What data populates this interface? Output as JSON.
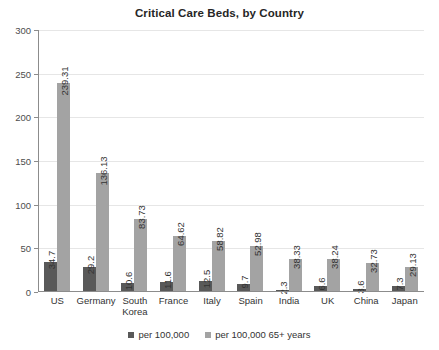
{
  "chart_data": {
    "type": "bar",
    "title": "Critical Care Beds, by Country",
    "xlabel": "",
    "ylabel": "",
    "ylim": [
      0,
      300
    ],
    "yticks": [
      0,
      50,
      100,
      150,
      200,
      250,
      300
    ],
    "grid": true,
    "legend_position": "bottom",
    "categories": [
      "US",
      "Germany",
      "South Korea",
      "France",
      "Italy",
      "Spain",
      "India",
      "UK",
      "China",
      "Japan"
    ],
    "series": [
      {
        "name": "per 100,000",
        "color": "#595959",
        "values": [
          34.7,
          29.2,
          10.6,
          11.6,
          12.5,
          9.7,
          2.3,
          6.6,
          3.6,
          7.3
        ],
        "labels": [
          "34.7",
          "29.2",
          "10.6",
          "11.6",
          "12.5",
          "9.7",
          "2.3",
          "6.6",
          "3.6",
          "7.3"
        ]
      },
      {
        "name": "per 100,000 65+ years",
        "color": "#a3a3a3",
        "values": [
          239.31,
          136.13,
          83.73,
          64.62,
          58.82,
          52.98,
          38.33,
          38.24,
          32.73,
          29.13
        ],
        "labels": [
          "239.31",
          "136.13",
          "83.73",
          "64.62",
          "58.82",
          "52.98",
          "38.33",
          "38.24",
          "32.73",
          "29.13"
        ]
      }
    ]
  },
  "colors": {
    "series_dark": "#595959",
    "series_light": "#a3a3a3",
    "axis": "#8c8c8c",
    "grid": "#e6e6e6",
    "text": "#333333",
    "background": "#ffffff"
  }
}
